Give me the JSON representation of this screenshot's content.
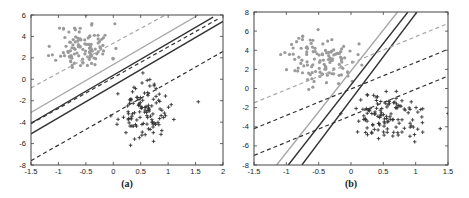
{
  "chart_data": [
    {
      "id": "a",
      "type": "scatter",
      "title": "",
      "caption": "(a)",
      "xlabel": "",
      "ylabel": "",
      "xlim": [
        -1.5,
        2
      ],
      "ylim": [
        -8,
        6
      ],
      "xticks": [
        -1.5,
        -1,
        -0.5,
        0,
        0.5,
        1,
        1.5,
        2
      ],
      "xtick_labels": [
        "-1.5",
        "-1",
        "-0.5",
        "0",
        "0.5",
        "1",
        "1.5",
        "2"
      ],
      "yticks": [
        -8,
        -6,
        -4,
        -2,
        0,
        2,
        4,
        6
      ],
      "ytick_labels": [
        "-8",
        "-6",
        "-4",
        "-2",
        "0",
        "2",
        "4",
        "6"
      ],
      "grid": false,
      "legend": null,
      "frame_px": {
        "left": 31,
        "top": 15,
        "right": 223,
        "bottom": 165
      },
      "series": [
        {
          "name": "class +1 (gray dots)",
          "marker": "dot",
          "color": "#9a9a9a",
          "center": [
            -0.55,
            3.0
          ],
          "spread": [
            0.25,
            1.1
          ],
          "count": 110,
          "seed": 11
        },
        {
          "name": "class -1 (dark crosses)",
          "marker": "plus",
          "color": "#333333",
          "center": [
            0.55,
            -3.1
          ],
          "spread": [
            0.22,
            1.2
          ],
          "count": 115,
          "seed": 23
        }
      ],
      "lines": [
        {
          "name": "gray solid",
          "color": "#a8a8a8",
          "dash": false,
          "width": 1.4,
          "p1": [
            -1.5,
            -3.1
          ],
          "p2": [
            1.55,
            6.0
          ]
        },
        {
          "name": "gray dashed",
          "color": "#a8a8a8",
          "dash": true,
          "width": 1.2,
          "p1": [
            -1.5,
            -0.8
          ],
          "p2": [
            0.95,
            6.0
          ]
        },
        {
          "name": "black solid upper",
          "color": "#333333",
          "dash": false,
          "width": 1.4,
          "p1": [
            -1.5,
            -4.1
          ],
          "p2": [
            1.82,
            5.8
          ]
        },
        {
          "name": "black dashed middle",
          "color": "#333333",
          "dash": true,
          "width": 1.2,
          "p1": [
            -1.5,
            -4.15
          ],
          "p2": [
            1.9,
            5.6
          ]
        },
        {
          "name": "black solid lower",
          "color": "#333333",
          "dash": false,
          "width": 1.4,
          "p1": [
            -1.5,
            -5.1
          ],
          "p2": [
            2.0,
            5.4
          ]
        },
        {
          "name": "black dashed lower",
          "color": "#333333",
          "dash": true,
          "width": 1.2,
          "p1": [
            -1.5,
            -7.6
          ],
          "p2": [
            2.0,
            2.6
          ]
        }
      ],
      "outliers": [
        {
          "marker": "plus",
          "x": 1.55,
          "y": -2.1
        }
      ]
    },
    {
      "id": "b",
      "type": "scatter",
      "title": "",
      "caption": "(b)",
      "xlabel": "",
      "ylabel": "",
      "xlim": [
        -1.5,
        1.5
      ],
      "ylim": [
        -8,
        8
      ],
      "xticks": [
        -1.5,
        -1,
        -0.5,
        0,
        0.5,
        1,
        1.5
      ],
      "xtick_labels": [
        "-1.5",
        "-1",
        "-0.5",
        "0",
        "0.5",
        "1",
        "1.5"
      ],
      "yticks": [
        -8,
        -6,
        -4,
        -2,
        0,
        2,
        4,
        6,
        8
      ],
      "ytick_labels": [
        "-8",
        "-6",
        "-4",
        "-2",
        "0",
        "2",
        "4",
        "6",
        "8"
      ],
      "grid": false,
      "legend": null,
      "frame_px": {
        "left": 254,
        "top": 12,
        "right": 448,
        "bottom": 165
      },
      "series": [
        {
          "name": "class +1 (gray dots)",
          "marker": "dot",
          "color": "#9a9a9a",
          "center": [
            -0.45,
            3.0
          ],
          "spread": [
            0.27,
            1.3
          ],
          "count": 115,
          "seed": 37
        },
        {
          "name": "class -1 (dark crosses)",
          "marker": "plus",
          "color": "#333333",
          "center": [
            0.55,
            -3.0
          ],
          "spread": [
            0.28,
            1.25
          ],
          "count": 120,
          "seed": 51
        }
      ],
      "lines": [
        {
          "name": "gray solid",
          "color": "#a8a8a8",
          "dash": false,
          "width": 1.4,
          "p1": [
            -1.15,
            -8.0
          ],
          "p2": [
            0.72,
            8.0
          ]
        },
        {
          "name": "black solid left",
          "color": "#333333",
          "dash": false,
          "width": 1.4,
          "p1": [
            -0.97,
            -8.0
          ],
          "p2": [
            0.88,
            8.0
          ]
        },
        {
          "name": "black solid right",
          "color": "#333333",
          "dash": false,
          "width": 1.4,
          "p1": [
            -0.76,
            -8.0
          ],
          "p2": [
            1.02,
            8.0
          ]
        },
        {
          "name": "gray dashed",
          "color": "#a8a8a8",
          "dash": true,
          "width": 1.2,
          "p1": [
            -1.5,
            -1.5
          ],
          "p2": [
            1.5,
            6.8
          ]
        },
        {
          "name": "black dashed middle",
          "color": "#333333",
          "dash": true,
          "width": 1.2,
          "p1": [
            -1.5,
            -4.2
          ],
          "p2": [
            1.5,
            4.1
          ]
        },
        {
          "name": "black dashed lower",
          "color": "#333333",
          "dash": true,
          "width": 1.2,
          "p1": [
            -1.5,
            -7.0
          ],
          "p2": [
            1.5,
            1.3
          ]
        }
      ],
      "outliers": [
        {
          "marker": "plus",
          "x": 1.38,
          "y": -4.2
        },
        {
          "marker": "plus",
          "x": 1.5,
          "y": -2.6
        }
      ]
    }
  ]
}
